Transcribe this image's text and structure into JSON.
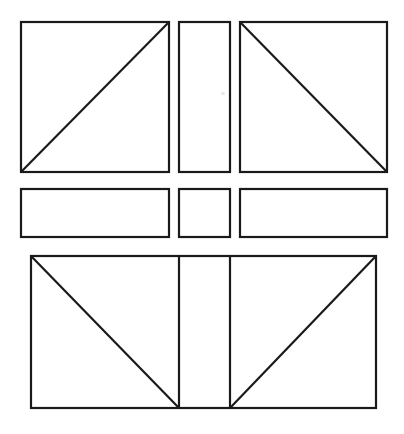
{
  "figure": {
    "title": "Geometric dissection diagram",
    "description": "Line drawing of nine rectangular panels arranged in three rows, several crossed by single diagonal lines.",
    "canvas": {
      "width": 404,
      "height": 434
    },
    "style": {
      "background_color": "#ffffff",
      "line_color": "#1a1a1a",
      "line_width": 2.2,
      "fill_color": "#ffffff"
    },
    "rows": [
      {
        "name": "top-row",
        "label": "Top row",
        "panels": [
          {
            "name": "top-left-square",
            "label": "Top left square with rising diagonal",
            "shape": "square",
            "x": 21,
            "y": 22,
            "width": 148,
            "height": 150,
            "diagonal": "bottom-left-to-top-right"
          },
          {
            "name": "top-middle-rectangle",
            "label": "Top middle tall rectangle",
            "shape": "rectangle",
            "x": 179,
            "y": 22,
            "width": 51,
            "height": 150,
            "diagonal": "none"
          },
          {
            "name": "top-right-square",
            "label": "Top right square with falling diagonal",
            "shape": "square",
            "x": 240,
            "y": 22,
            "width": 147,
            "height": 150,
            "diagonal": "top-left-to-bottom-right"
          }
        ]
      },
      {
        "name": "middle-row",
        "label": "Middle row",
        "panels": [
          {
            "name": "middle-left-rectangle",
            "label": "Middle left wide rectangle",
            "shape": "rectangle",
            "x": 21,
            "y": 189,
            "width": 148,
            "height": 48,
            "diagonal": "none"
          },
          {
            "name": "middle-center-square",
            "label": "Middle center small square",
            "shape": "square",
            "x": 179,
            "y": 189,
            "width": 51,
            "height": 48,
            "diagonal": "none"
          },
          {
            "name": "middle-right-rectangle",
            "label": "Middle right wide rectangle",
            "shape": "rectangle",
            "x": 240,
            "y": 189,
            "width": 147,
            "height": 48,
            "diagonal": "none"
          }
        ]
      },
      {
        "name": "bottom-row",
        "label": "Bottom row",
        "panels": [
          {
            "name": "bottom-outer-rectangle",
            "label": "Bottom wide rectangle spanning full band",
            "shape": "rectangle",
            "x": 31,
            "y": 256,
            "width": 345,
            "height": 152,
            "diagonal": "none"
          }
        ],
        "dividers": [
          {
            "name": "bottom-divider-left",
            "label": "Left vertical divider",
            "x": 179,
            "y1": 256,
            "y2": 408
          },
          {
            "name": "bottom-divider-right",
            "label": "Right vertical divider",
            "x": 230,
            "y1": 256,
            "y2": 408
          }
        ],
        "diagonals": [
          {
            "name": "bottom-left-diagonal",
            "label": "Diagonal from top-left corner to foot of left divider",
            "x1": 31,
            "y1": 256,
            "x2": 179,
            "y2": 408
          },
          {
            "name": "bottom-right-diagonal",
            "label": "Diagonal from foot of right divider to top-right corner",
            "x1": 230,
            "y1": 408,
            "x2": 376,
            "y2": 256
          }
        ]
      }
    ],
    "artifacts": [
      {
        "name": "scan-speck",
        "label": "Faint scanner speck",
        "x": 221,
        "y": 92,
        "width": 4,
        "height": 3
      }
    ]
  }
}
